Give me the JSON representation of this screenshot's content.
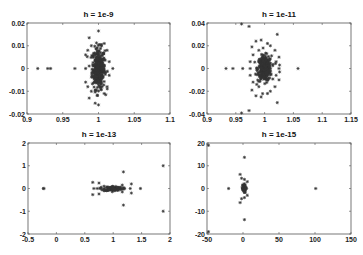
{
  "chart_data": [
    {
      "type": "scatter",
      "title": "h = 1e-9",
      "xlabel": "",
      "ylabel": "",
      "xlim": [
        0.9,
        1.1
      ],
      "ylim": [
        -0.02,
        0.02
      ],
      "xticks": [
        "0.9",
        "0.95",
        "1",
        "1.05",
        "1.1"
      ],
      "xtick_values": [
        0.9,
        0.95,
        1,
        1.05,
        1.1
      ],
      "yticks": [
        "0.02",
        "0.01",
        "0",
        "-0.01",
        "-0.02"
      ],
      "ytick_values": [
        0.02,
        0.01,
        0,
        -0.01,
        -0.02
      ],
      "box": [
        27,
        23,
        170,
        114
      ],
      "marker": "*",
      "cluster": {
        "cx": 1.0,
        "cy": 0.0,
        "sx": 0.0045,
        "sy": 0.0045,
        "n": 320
      },
      "points": [
        [
          0.915,
          0
        ],
        [
          0.929,
          0
        ],
        [
          0.933,
          0
        ],
        [
          0.967,
          0
        ],
        [
          1.02,
          0
        ],
        [
          1.0,
          0.0165
        ],
        [
          1.0,
          -0.016
        ],
        [
          0.987,
          0.0135
        ],
        [
          0.987,
          -0.013
        ],
        [
          0.985,
          0.008
        ],
        [
          0.985,
          -0.008
        ],
        [
          1.012,
          0.008
        ],
        [
          1.012,
          -0.008
        ],
        [
          0.982,
          0.006
        ],
        [
          0.982,
          -0.006
        ],
        [
          0.99,
          0.01
        ],
        [
          0.99,
          -0.01
        ],
        [
          1.008,
          0.011
        ],
        [
          1.008,
          -0.011
        ],
        [
          0.982,
          0.0
        ],
        [
          1.015,
          0.003
        ],
        [
          1.015,
          -0.003
        ]
      ]
    },
    {
      "type": "scatter",
      "title": "h = 1e-11",
      "xlabel": "",
      "ylabel": "",
      "xlim": [
        0.9,
        1.15
      ],
      "ylim": [
        -0.04,
        0.04
      ],
      "xticks": [
        "0.9",
        "0.95",
        "1",
        "1.05",
        "1.1",
        "1.15"
      ],
      "xtick_values": [
        0.9,
        0.95,
        1,
        1.05,
        1.1,
        1.15
      ],
      "yticks": [
        "0.04",
        "0.02",
        "0",
        "-0.02",
        "-0.04"
      ],
      "ytick_values": [
        0.04,
        0.02,
        0,
        -0.02,
        -0.04
      ],
      "box": [
        207,
        23,
        351,
        114
      ],
      "marker": "*",
      "cluster": {
        "cx": 1.0,
        "cy": 0.0,
        "sx": 0.006,
        "sy": 0.0055,
        "n": 320
      },
      "points": [
        [
          0.933,
          0
        ],
        [
          0.945,
          0
        ],
        [
          0.962,
          0
        ],
        [
          0.975,
          0
        ],
        [
          1.025,
          0
        ],
        [
          1.058,
          0
        ],
        [
          0.96,
          0.0395
        ],
        [
          0.96,
          -0.0395
        ],
        [
          0.973,
          0.037
        ],
        [
          0.973,
          -0.037
        ],
        [
          1.022,
          0.03
        ],
        [
          1.022,
          -0.03
        ],
        [
          0.985,
          0.024
        ],
        [
          0.985,
          -0.024
        ],
        [
          0.994,
          0.025
        ],
        [
          0.994,
          -0.025
        ],
        [
          1.005,
          0.022
        ],
        [
          1.005,
          -0.022
        ],
        [
          1.01,
          0.02
        ],
        [
          1.01,
          -0.02
        ],
        [
          1.018,
          0.016
        ],
        [
          1.018,
          -0.016
        ],
        [
          0.978,
          0.019
        ],
        [
          0.978,
          -0.019
        ],
        [
          1.025,
          0.01
        ],
        [
          1.025,
          -0.01
        ],
        [
          0.98,
          0.012
        ],
        [
          0.98,
          -0.012
        ],
        [
          1.02,
          0.006
        ],
        [
          1.02,
          -0.006
        ],
        [
          0.975,
          0.006
        ],
        [
          0.975,
          -0.006
        ],
        [
          0.99,
          0.016
        ],
        [
          0.99,
          -0.016
        ],
        [
          1.026,
          0.003
        ],
        [
          1.026,
          -0.003
        ]
      ]
    },
    {
      "type": "scatter",
      "title": "h = 1e-13",
      "xlabel": "",
      "ylabel": "",
      "xlim": [
        -0.5,
        2
      ],
      "ylim": [
        -2,
        2
      ],
      "xticks": [
        "-0.5",
        "0",
        "0.5",
        "1",
        "1.5",
        "2"
      ],
      "xtick_values": [
        -0.5,
        0,
        0.5,
        1,
        1.5,
        2
      ],
      "yticks": [
        "2",
        "1",
        "0",
        "-1",
        "-2"
      ],
      "ytick_values": [
        2,
        1,
        0,
        -1,
        -2
      ],
      "box": [
        28,
        143,
        170,
        234
      ],
      "marker": "*",
      "cluster": {
        "cx": 1.0,
        "cy": 0.0,
        "sx": 0.08,
        "sy": 0.05,
        "n": 90
      },
      "points": [
        [
          -0.23,
          0
        ],
        [
          -0.22,
          0
        ],
        [
          0.64,
          0.27
        ],
        [
          0.64,
          -0.27
        ],
        [
          0.75,
          0.24
        ],
        [
          0.75,
          -0.24
        ],
        [
          0.66,
          0
        ],
        [
          0.72,
          0
        ],
        [
          0.78,
          0
        ],
        [
          0.84,
          0.1
        ],
        [
          0.84,
          -0.1
        ],
        [
          1.18,
          0.73
        ],
        [
          1.18,
          -0.73
        ],
        [
          1.32,
          0.2
        ],
        [
          1.32,
          -0.2
        ],
        [
          1.3,
          0
        ],
        [
          1.48,
          0
        ],
        [
          1.2,
          0
        ],
        [
          1.16,
          0.15
        ],
        [
          1.16,
          -0.15
        ],
        [
          1.88,
          1.0
        ],
        [
          1.88,
          -1.0
        ]
      ]
    },
    {
      "type": "scatter",
      "title": "h = 1e-15",
      "xlabel": "",
      "ylabel": "",
      "xlim": [
        -50,
        150
      ],
      "ylim": [
        -20,
        20
      ],
      "xticks": [
        "-50",
        "0",
        "50",
        "100",
        "150"
      ],
      "xtick_values": [
        -50,
        0,
        50,
        100,
        150
      ],
      "yticks": [
        "20",
        "10",
        "0",
        "-10",
        "-20"
      ],
      "ytick_values": [
        20,
        10,
        0,
        -10,
        -20
      ],
      "box": [
        207,
        143,
        351,
        234
      ],
      "marker": "*",
      "cluster": {
        "cx": 1.0,
        "cy": 0.0,
        "sx": 1.2,
        "sy": 0.9,
        "n": 60
      },
      "points": [
        [
          -20,
          0
        ],
        [
          101,
          0
        ],
        [
          2,
          13.7
        ],
        [
          2,
          -13.7
        ],
        [
          -4,
          6.2
        ],
        [
          -4,
          -6.2
        ],
        [
          -2,
          4.5
        ],
        [
          -2,
          -4.5
        ],
        [
          2,
          4
        ],
        [
          2,
          -4
        ],
        [
          6,
          3
        ],
        [
          6,
          -3
        ],
        [
          5,
          0
        ],
        [
          -48,
          19
        ],
        [
          -48,
          -19
        ]
      ]
    }
  ]
}
